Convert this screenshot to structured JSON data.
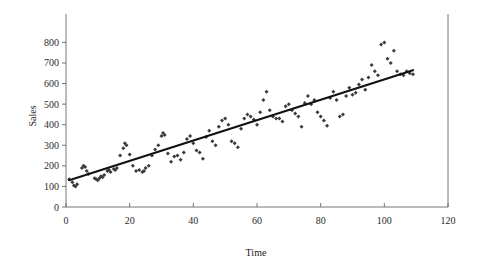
{
  "chart_data": {
    "type": "scatter",
    "title": "",
    "xlabel": "Time",
    "ylabel": "Sales",
    "xlim": [
      0,
      120
    ],
    "ylim": [
      0,
      870
    ],
    "xticks": [
      0,
      20,
      40,
      60,
      80,
      100,
      120
    ],
    "yticks": [
      0,
      100,
      200,
      300,
      400,
      500,
      600,
      700,
      800
    ],
    "xtick_labels": [
      "0",
      "20",
      "40",
      "60",
      "80",
      "100",
      "120"
    ],
    "ytick_labels": [
      "0",
      "100",
      "200",
      "300",
      "400",
      "500",
      "600",
      "700",
      "800"
    ],
    "grid": false,
    "legend": null,
    "legend_position": "none",
    "marker": "diamond",
    "marker_color": "#3a3a3a",
    "line_color": "#111111",
    "series": [
      {
        "name": "Sales",
        "x": [
          1,
          2,
          2.5,
          3,
          3.5,
          5,
          5.5,
          6,
          6.5,
          7,
          9,
          9.5,
          10,
          10.5,
          11,
          11.5,
          12,
          13,
          13.5,
          14,
          15,
          15.5,
          16,
          17,
          18,
          18.5,
          19,
          20,
          21,
          22,
          23,
          24,
          24.5,
          25,
          26,
          27,
          28,
          29,
          30,
          30.5,
          31,
          32,
          33,
          34,
          35,
          36,
          37,
          38,
          39,
          40,
          41,
          42,
          43,
          44,
          45,
          46,
          47,
          48,
          49,
          50,
          51,
          52,
          53,
          54,
          55,
          56,
          57,
          58,
          59,
          60,
          61,
          62,
          63,
          64,
          65,
          66,
          67,
          68,
          69,
          70,
          71,
          72,
          73,
          74,
          75,
          76,
          77,
          78,
          79,
          80,
          81,
          82,
          83,
          84,
          85,
          86,
          87,
          88,
          89,
          90,
          91,
          92,
          93,
          94,
          95,
          96,
          97,
          98,
          99,
          100,
          101,
          102,
          103,
          104,
          105,
          106,
          107,
          108,
          109
        ],
        "y": [
          135,
          120,
          105,
          100,
          110,
          190,
          200,
          195,
          175,
          160,
          140,
          135,
          130,
          140,
          150,
          145,
          155,
          175,
          180,
          170,
          185,
          180,
          190,
          250,
          285,
          310,
          300,
          255,
          200,
          175,
          180,
          170,
          175,
          190,
          200,
          250,
          280,
          300,
          345,
          360,
          350,
          260,
          220,
          245,
          250,
          230,
          265,
          330,
          345,
          310,
          275,
          265,
          235,
          340,
          370,
          320,
          300,
          390,
          420,
          430,
          400,
          320,
          310,
          290,
          380,
          430,
          450,
          440,
          425,
          400,
          460,
          520,
          560,
          470,
          440,
          430,
          430,
          415,
          490,
          500,
          470,
          455,
          440,
          390,
          505,
          540,
          500,
          520,
          460,
          440,
          420,
          395,
          530,
          560,
          520,
          440,
          450,
          540,
          580,
          545,
          555,
          595,
          620,
          570,
          630,
          690,
          660,
          640,
          790,
          800,
          720,
          700,
          760,
          660,
          645,
          640,
          660,
          650,
          645
        ]
      }
    ],
    "trend_line": {
      "name": "linear fit",
      "x_start": 1,
      "y_start": 130,
      "x_end": 109,
      "y_end": 665,
      "slope": 4.95,
      "intercept": 125
    }
  },
  "axes": {
    "x_title": "Time",
    "y_title": "Sales"
  }
}
